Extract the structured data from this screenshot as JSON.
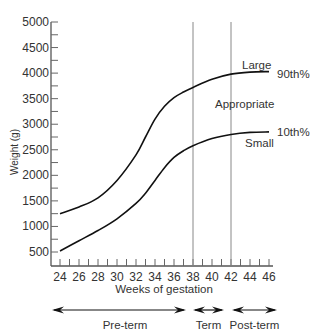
{
  "chart_data": {
    "type": "line",
    "title": "",
    "xlabel": "Weeks of gestation",
    "ylabel": "Weight (g)",
    "xlim": [
      24,
      46
    ],
    "ylim": [
      500,
      5000
    ],
    "grid": false,
    "x_ticks": [
      24,
      26,
      28,
      30,
      32,
      34,
      36,
      38,
      40,
      42,
      44,
      46
    ],
    "y_ticks": [
      500,
      1000,
      1500,
      2000,
      2500,
      3000,
      3500,
      4000,
      4500,
      5000
    ],
    "x": [
      24,
      26,
      28,
      30,
      32,
      33,
      34,
      35,
      36,
      37,
      38,
      40,
      42,
      44,
      46
    ],
    "series": [
      {
        "name": "90th%",
        "values": [
          1250,
          1380,
          1560,
          1900,
          2400,
          2750,
          3100,
          3350,
          3520,
          3630,
          3720,
          3880,
          3980,
          4020,
          4030
        ]
      },
      {
        "name": "10th%",
        "values": [
          520,
          720,
          920,
          1150,
          1450,
          1650,
          1900,
          2150,
          2350,
          2480,
          2580,
          2720,
          2800,
          2840,
          2850
        ]
      }
    ],
    "vertical_lines": [
      38,
      42
    ],
    "annotations": {
      "large": "Large",
      "appropriate": "Appropriate",
      "small": "Small",
      "p90": "90th%",
      "p10": "10th%"
    },
    "periods": [
      {
        "label": "Pre-term",
        "from": 24,
        "to": 38
      },
      {
        "label": "Term",
        "from": 38,
        "to": 42
      },
      {
        "label": "Post-term",
        "from": 42,
        "to": 46
      }
    ]
  }
}
